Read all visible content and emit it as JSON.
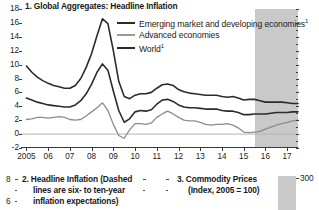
{
  "figure": {
    "panels": [
      {
        "id": "panel-1",
        "title": "1. Global Aggregates: Headline Inflation",
        "legend": [
          {
            "label": "Emerging market and developing economies",
            "footnote": "1",
            "color": "#2b2b2b"
          },
          {
            "label": "Advanced economies",
            "footnote": "",
            "color": "#8c8c8c"
          },
          {
            "label": "World",
            "footnote": "1",
            "color": "#2b2b2b"
          }
        ]
      },
      {
        "id": "panel-2",
        "title_line1": "2. Headline Inflation (Dashed",
        "title_line2": "lines are six- to ten-year",
        "title_line3": "inflation expectations)",
        "ylabel_top": "8",
        "ylabel_next": "6"
      },
      {
        "id": "panel-3",
        "title_line1": "3. Commodity Prices",
        "title_line2": "(Index, 2005 = 100)",
        "right_label": "300"
      }
    ]
  },
  "chart_data": {
    "type": "line",
    "title": "1. Global Aggregates: Headline Inflation",
    "xlabel": "",
    "ylabel": "",
    "xlim": [
      2004.75,
      2017.5
    ],
    "ylim": [
      -2,
      18
    ],
    "yticks": [
      18,
      16,
      14,
      12,
      10,
      8,
      6,
      4,
      2,
      0,
      -2
    ],
    "xticks": [
      2005,
      2006,
      2007,
      2008,
      2009,
      2010,
      2011,
      2012,
      2013,
      2014,
      2015,
      2016,
      2017
    ],
    "xticklabels": [
      "2005",
      "06",
      "07",
      "08",
      "09",
      "10",
      "11",
      "12",
      "13",
      "14",
      "15",
      "16",
      "17"
    ],
    "grid": false,
    "legend_position": "upper-center",
    "zero_line": 0,
    "forecast_shading": {
      "start": 2015.5,
      "end": 2017.5,
      "color": "#c9c9c9"
    },
    "x": [
      2005.0,
      2005.25,
      2005.5,
      2005.75,
      2006.0,
      2006.25,
      2006.5,
      2006.75,
      2007.0,
      2007.25,
      2007.5,
      2007.75,
      2008.0,
      2008.25,
      2008.5,
      2008.75,
      2009.0,
      2009.25,
      2009.5,
      2009.75,
      2010.0,
      2010.25,
      2010.5,
      2010.75,
      2011.0,
      2011.25,
      2011.5,
      2011.75,
      2012.0,
      2012.25,
      2012.5,
      2012.75,
      2013.0,
      2013.25,
      2013.5,
      2013.75,
      2014.0,
      2014.25,
      2014.5,
      2014.75,
      2015.0,
      2015.25,
      2015.5,
      2015.75,
      2016.0,
      2016.25,
      2016.5,
      2016.75,
      2017.0,
      2017.25,
      2017.5
    ],
    "series": [
      {
        "name": "Emerging market and developing economies",
        "color": "#2b2b2b",
        "width": 1.6,
        "values": [
          9.8,
          8.9,
          8.2,
          7.7,
          7.3,
          7.0,
          6.8,
          6.6,
          6.6,
          7.0,
          8.0,
          9.6,
          11.6,
          14.2,
          16.6,
          15.9,
          12.0,
          7.6,
          5.4,
          5.1,
          5.6,
          5.8,
          5.8,
          6.0,
          6.6,
          7.1,
          7.2,
          7.0,
          6.4,
          6.1,
          5.9,
          5.8,
          5.7,
          5.6,
          5.6,
          5.6,
          5.4,
          5.3,
          5.4,
          5.2,
          4.9,
          5.0,
          5.0,
          4.8,
          4.6,
          4.6,
          4.6,
          4.6,
          4.5,
          4.4,
          4.4
        ]
      },
      {
        "name": "World",
        "color": "#2b2b2b",
        "width": 1.6,
        "values": [
          5.2,
          4.9,
          4.6,
          4.4,
          4.2,
          4.1,
          4.0,
          3.9,
          3.9,
          4.2,
          4.8,
          5.8,
          7.2,
          8.9,
          10.1,
          9.2,
          6.2,
          3.4,
          1.7,
          2.2,
          3.2,
          3.4,
          3.3,
          3.5,
          4.3,
          4.9,
          5.0,
          4.7,
          4.2,
          3.9,
          3.8,
          3.8,
          3.7,
          3.6,
          3.6,
          3.6,
          3.4,
          3.3,
          3.3,
          3.1,
          2.8,
          2.8,
          2.9,
          2.9,
          2.9,
          3.0,
          3.1,
          3.1,
          3.1,
          3.2,
          3.2
        ]
      },
      {
        "name": "Advanced economies",
        "color": "#8c8c8c",
        "width": 1.3,
        "values": [
          2.1,
          2.2,
          2.4,
          2.4,
          2.3,
          2.4,
          2.5,
          2.4,
          2.1,
          2.0,
          2.1,
          2.6,
          3.2,
          3.8,
          4.5,
          3.4,
          1.4,
          -0.2,
          -0.6,
          0.6,
          1.5,
          1.5,
          1.4,
          1.6,
          2.4,
          2.9,
          3.3,
          2.9,
          2.4,
          2.0,
          1.9,
          1.9,
          1.7,
          1.4,
          1.3,
          1.4,
          1.4,
          1.5,
          1.3,
          0.9,
          0.3,
          0.2,
          0.3,
          0.4,
          0.7,
          1.0,
          1.3,
          1.5,
          1.7,
          1.9,
          2.0
        ]
      }
    ]
  }
}
